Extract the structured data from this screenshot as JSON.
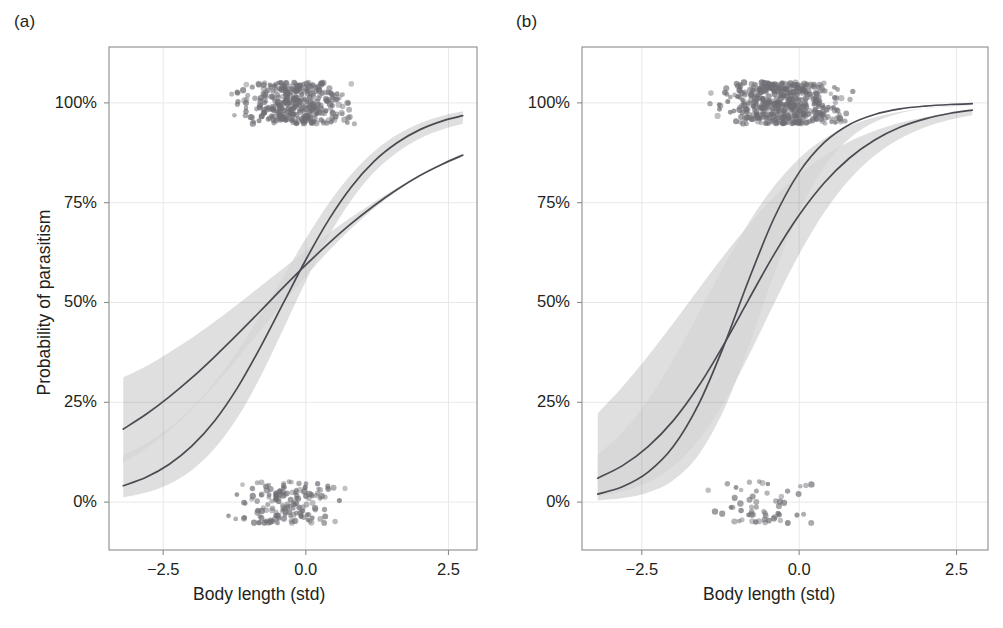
{
  "figure": {
    "panels": [
      {
        "id": "a",
        "label": "(a)",
        "xlabel": "Body length (std)",
        "ylabel": "Probability of parasitism"
      },
      {
        "id": "b",
        "label": "(b)",
        "xlabel": "Body length (std)",
        "ylabel": "Probability of parasitism"
      }
    ]
  },
  "axes": {
    "x_ticks": [
      "−2.5",
      "0.0",
      "2.5"
    ],
    "x_tick_values": [
      -2.5,
      0.0,
      2.5
    ],
    "y_ticks": [
      "0%",
      "25%",
      "50%",
      "75%",
      "100%"
    ],
    "y_tick_values": [
      0,
      25,
      50,
      75,
      100
    ]
  },
  "colors": {
    "curve": "#4a4a52",
    "band_light": "#d6d6d6",
    "band_overlap": "#bcbcbc",
    "points": "#6e6e74",
    "frame": "#8c8c8c",
    "grid": "#e8e8ea",
    "text": "#231f20",
    "background": "#ffffff"
  },
  "chart_data": {
    "type": "line",
    "title": "",
    "xlabel": "Body length (std)",
    "ylabel": "Probability of parasitism",
    "xlim": [
      -3.45,
      3.0
    ],
    "ylim": [
      -0.12,
      1.14
    ],
    "grid": true,
    "legend": "none",
    "panels": [
      {
        "panel": "a",
        "series": [
          {
            "name": "logistic-curve-steep",
            "kind": "line",
            "model": "logistic",
            "intercept": 0.6,
            "slope": 1.12,
            "x0": -0.54,
            "x": [
              -3.2,
              -2.8,
              -2.4,
              -2.0,
              -1.6,
              -1.2,
              -0.8,
              -0.4,
              0.0,
              0.4,
              0.8,
              1.2,
              1.6,
              2.0,
              2.4,
              2.75
            ],
            "y": [
              0.041,
              0.062,
              0.094,
              0.14,
              0.203,
              0.286,
              0.387,
              0.497,
              0.607,
              0.707,
              0.79,
              0.854,
              0.9,
              0.933,
              0.955,
              0.968
            ]
          },
          {
            "name": "logistic-curve-shallow",
            "kind": "line",
            "model": "logistic",
            "intercept": 0.52,
            "slope": 0.62,
            "x0": -0.84,
            "x": [
              -3.2,
              -2.8,
              -2.4,
              -2.0,
              -1.6,
              -1.2,
              -0.8,
              -0.4,
              0.0,
              0.4,
              0.8,
              1.2,
              1.6,
              2.0,
              2.4,
              2.75
            ],
            "y": [
              0.183,
              0.22,
              0.263,
              0.311,
              0.364,
              0.42,
              0.478,
              0.537,
              0.594,
              0.648,
              0.698,
              0.743,
              0.783,
              0.818,
              0.847,
              0.869
            ]
          },
          {
            "name": "ci-band-steep",
            "kind": "band",
            "x": [
              -3.2,
              -2.8,
              -2.4,
              -2.0,
              -1.6,
              -1.2,
              -0.8,
              -0.4,
              0.0,
              0.4,
              0.8,
              1.2,
              1.6,
              2.0,
              2.4,
              2.75
            ],
            "lower": [
              0.012,
              0.024,
              0.045,
              0.08,
              0.134,
              0.211,
              0.313,
              0.432,
              0.554,
              0.666,
              0.757,
              0.827,
              0.876,
              0.911,
              0.934,
              0.948
            ],
            "upper": [
              0.118,
              0.147,
              0.186,
              0.236,
              0.3,
              0.378,
              0.468,
              0.564,
              0.66,
              0.748,
              0.822,
              0.879,
              0.92,
              0.949,
              0.968,
              0.979
            ]
          },
          {
            "name": "ci-band-shallow",
            "kind": "band",
            "x": [
              -3.2,
              -2.8,
              -2.4,
              -2.0,
              -1.6,
              -1.2,
              -0.8,
              -0.4,
              0.0,
              0.4,
              0.8,
              1.2,
              1.6,
              2.0,
              2.4,
              2.75
            ],
            "lower": [
              0.098,
              0.134,
              0.178,
              0.231,
              0.292,
              0.359,
              0.429,
              0.499,
              0.566,
              0.629,
              0.686,
              0.736,
              0.78,
              0.818,
              0.85,
              0.873
            ],
            "upper": [
              0.312,
              0.34,
              0.374,
              0.411,
              0.452,
              0.495,
              0.54,
              0.585,
              0.63,
              0.673,
              0.714,
              0.752,
              0.787,
              0.818,
              0.845,
              0.866
            ]
          }
        ],
        "scatter": {
          "name": "observed-outcomes",
          "y_levels": [
            0,
            1
          ],
          "n_points": 520,
          "jitter": true,
          "description": "binary parasitism outcomes jittered at 0% and 100%"
        }
      },
      {
        "panel": "b",
        "series": [
          {
            "name": "logistic-curve-steep",
            "kind": "line",
            "model": "logistic",
            "intercept": 1.55,
            "slope": 1.72,
            "x0": -0.9,
            "x": [
              -3.2,
              -2.8,
              -2.4,
              -2.0,
              -1.6,
              -1.2,
              -0.8,
              -0.4,
              0.0,
              0.4,
              0.8,
              1.2,
              1.6,
              2.0,
              2.4,
              2.75
            ],
            "y": [
              0.02,
              0.039,
              0.075,
              0.139,
              0.244,
              0.39,
              0.557,
              0.711,
              0.826,
              0.901,
              0.946,
              0.971,
              0.985,
              0.992,
              0.996,
              0.998
            ]
          },
          {
            "name": "logistic-curve-shallow",
            "kind": "line",
            "model": "logistic",
            "intercept": 1.1,
            "slope": 1.18,
            "x0": -0.93,
            "x": [
              -3.2,
              -2.8,
              -2.4,
              -2.0,
              -1.6,
              -1.2,
              -0.8,
              -0.4,
              0.0,
              0.4,
              0.8,
              1.2,
              1.6,
              2.0,
              2.4,
              2.75
            ],
            "y": [
              0.06,
              0.092,
              0.139,
              0.204,
              0.29,
              0.394,
              0.508,
              0.62,
              0.719,
              0.8,
              0.862,
              0.907,
              0.939,
              0.96,
              0.974,
              0.982
            ]
          },
          {
            "name": "ci-band-steep",
            "kind": "band",
            "x": [
              -3.2,
              -2.8,
              -2.4,
              -2.0,
              -1.6,
              -1.2,
              -0.8,
              -0.4,
              0.0,
              0.4,
              0.8,
              1.2,
              1.6,
              2.0,
              2.4,
              2.75
            ],
            "lower": [
              0.004,
              0.01,
              0.024,
              0.055,
              0.118,
              0.23,
              0.39,
              0.57,
              0.727,
              0.84,
              0.911,
              0.952,
              0.974,
              0.986,
              0.992,
              0.996
            ],
            "upper": [
              0.118,
              0.176,
              0.256,
              0.357,
              0.472,
              0.59,
              0.7,
              0.791,
              0.861,
              0.91,
              0.943,
              0.964,
              0.978,
              0.986,
              0.991,
              0.994
            ]
          },
          {
            "name": "ci-band-shallow",
            "kind": "band",
            "x": [
              -3.2,
              -2.8,
              -2.4,
              -2.0,
              -1.6,
              -1.2,
              -0.8,
              -0.4,
              0.0,
              0.4,
              0.8,
              1.2,
              1.6,
              2.0,
              2.4,
              2.75
            ],
            "lower": [
              0.014,
              0.027,
              0.05,
              0.09,
              0.155,
              0.248,
              0.367,
              0.497,
              0.621,
              0.726,
              0.808,
              0.868,
              0.91,
              0.939,
              0.958,
              0.969
            ],
            "upper": [
              0.222,
              0.29,
              0.366,
              0.448,
              0.533,
              0.617,
              0.695,
              0.764,
              0.821,
              0.867,
              0.903,
              0.93,
              0.95,
              0.964,
              0.975,
              0.981
            ]
          }
        ],
        "scatter": {
          "name": "observed-outcomes",
          "y_levels": [
            0,
            1
          ],
          "n_points": 520,
          "jitter": true,
          "description": "binary parasitism outcomes jittered at 0% and 100%"
        }
      }
    ]
  }
}
